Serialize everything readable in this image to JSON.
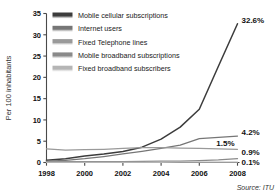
{
  "chart_data": {
    "type": "line",
    "title": "",
    "xlabel": "",
    "ylabel": "Per 100 inhabitants",
    "x": [
      1998,
      1999,
      2000,
      2001,
      2002,
      2003,
      2004,
      2005,
      2006,
      2007,
      2008
    ],
    "xlim": [
      1998,
      2008
    ],
    "ylim": [
      0,
      35
    ],
    "xticks": [
      "1998",
      "2000",
      "2002",
      "2004",
      "2006",
      "2008"
    ],
    "yticks": [
      "0",
      "5",
      "10",
      "15",
      "20",
      "25",
      "30",
      "35"
    ],
    "grid": false,
    "legend_position": "top-left",
    "source": "Source: ITU",
    "series": [
      {
        "name": "Mobile cellular subscriptions",
        "color": "#3c3c3c",
        "end_label": "32.6%",
        "end_value": 32.6,
        "values": [
          0.5,
          0.9,
          1.5,
          2.0,
          2.6,
          3.6,
          5.5,
          8.3,
          12.5,
          22.6,
          32.6
        ]
      },
      {
        "name": "Internet users",
        "color": "#767676",
        "end_label": "4.2%",
        "end_value": 4.2,
        "values": [
          0.3,
          0.5,
          0.9,
          1.4,
          2.0,
          2.6,
          3.3,
          4.1,
          5.6,
          5.9,
          6.2
        ]
      },
      {
        "name": "Fixed Telephone lines",
        "color": "#9a9a9a",
        "end_label": "1.5%",
        "end_value": 1.5,
        "values": [
          3.2,
          2.9,
          3.0,
          3.1,
          3.3,
          3.5,
          3.5,
          3.4,
          3.3,
          3.2,
          3.1
        ]
      },
      {
        "name": "Mobile broadband subscriptions",
        "color": "#8a8a8a",
        "end_label": "0.9%",
        "end_value": 0.9,
        "values": [
          0.2,
          0.2,
          0.2,
          0.2,
          0.2,
          0.25,
          0.3,
          0.35,
          0.45,
          0.6,
          0.9
        ]
      },
      {
        "name": "Fixed broadband subscribers",
        "color": "#b5b5b5",
        "end_label": "0.1%",
        "end_value": 0.1,
        "values": [
          0.02,
          0.02,
          0.03,
          0.03,
          0.04,
          0.05,
          0.05,
          0.06,
          0.07,
          0.08,
          0.1
        ]
      }
    ],
    "end_labels": [
      "32.6%",
      "4.2%",
      "1.5%",
      "0.9%",
      "0.1%"
    ]
  },
  "legend": {
    "items": [
      {
        "label": "Mobile cellular subscriptions",
        "color": "#3c3c3c"
      },
      {
        "label": "Internet users",
        "color": "#767676"
      },
      {
        "label": "Fixed Telephone lines",
        "color": "#9a9a9a"
      },
      {
        "label": "Mobile broadband subscriptions",
        "color": "#8a8a8a"
      },
      {
        "label": "Fixed broadband subscribers",
        "color": "#b5b5b5"
      }
    ]
  },
  "axes": {
    "y_title": "Per 100 inhabitants",
    "y_ticks": [
      "35",
      "30",
      "25",
      "20",
      "15",
      "10",
      "5",
      "0"
    ],
    "x_ticks": [
      "1998",
      "2000",
      "2002",
      "2004",
      "2006",
      "2008"
    ]
  },
  "footer": {
    "source": "Source: ITU"
  }
}
